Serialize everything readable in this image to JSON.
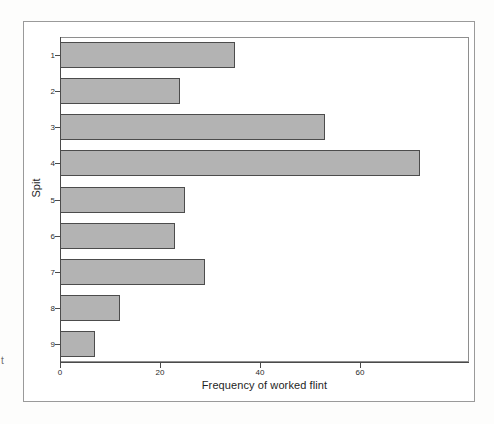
{
  "chart_data": {
    "type": "bar",
    "orientation": "horizontal",
    "title": "",
    "subtitle": "",
    "xlabel": "Frequency of worked flint",
    "ylabel": "Spit",
    "categories": [
      "1",
      "2",
      "3",
      "4",
      "5",
      "6",
      "7",
      "8",
      "9"
    ],
    "values": [
      35,
      24,
      53,
      72,
      25,
      23,
      29,
      12,
      7
    ],
    "series": [
      {
        "name": "Frequency of worked flint",
        "values": [
          35,
          24,
          53,
          72,
          25,
          23,
          29,
          12,
          7
        ]
      }
    ],
    "xlim": [
      0,
      81.8
    ],
    "xticks": [
      0,
      20,
      40,
      60
    ],
    "xtick_labels": [
      "0",
      "20",
      "40",
      "60"
    ],
    "ytick_labels": [
      "1",
      "2",
      "3",
      "4",
      "5",
      "6",
      "7",
      "8",
      "9"
    ],
    "grid": false,
    "legend": null,
    "legend_position": "none",
    "bar_fill_color": "#b3b3b3",
    "bar_edge_color": "#4c4c4c",
    "axis_color": "#4a4a4a",
    "frame_color": "#9a9a9a",
    "background_color": "#ffffff",
    "annotations": []
  },
  "figure": {
    "xaxis_title": "Frequency of worked flint",
    "yaxis_title": "Spit",
    "scan_artifact_glyph": "t"
  }
}
